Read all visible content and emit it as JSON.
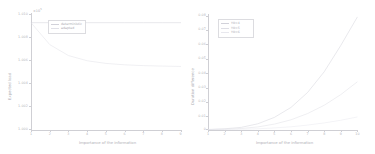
{
  "figure": {
    "panels": 2,
    "background": "#ffffff",
    "line_palette": [
      "#d7d7de",
      "#e3e3ea",
      "#ebebf1"
    ]
  },
  "left_panel": {
    "xlabel": "Importance of the information",
    "ylabel": "Expected load",
    "offset_label": "×10",
    "offset_exponent": "5",
    "ytick_labels": [
      "1.000",
      "1.002",
      "1.004",
      "1.006",
      "1.008",
      "1.010"
    ],
    "xtick_labels": [
      "1",
      "2",
      "3",
      "4",
      "5",
      "6",
      "7",
      "8",
      "9"
    ],
    "legend": {
      "items": [
        {
          "label": "deterministic",
          "color": "#d2d2da"
        },
        {
          "label": "adapted",
          "color": "#e0e0e7"
        }
      ]
    }
  },
  "right_panel": {
    "xlabel": "Importance of the information",
    "ylabel": "Duration difference",
    "ytick_labels": [
      "0",
      "0.01",
      "0.02",
      "0.03",
      "0.04",
      "0.05",
      "0.06",
      "0.07",
      "0.08"
    ],
    "xtick_labels": [
      "1",
      "2",
      "3",
      "4",
      "5",
      "6",
      "7",
      "8",
      "9",
      "10"
    ],
    "legend": {
      "items": [
        {
          "label": "Y0=4",
          "color": "#d2d2da"
        },
        {
          "label": "Y0=5",
          "color": "#dedee5"
        },
        {
          "label": "Y0=6",
          "color": "#e8e8ee"
        }
      ]
    }
  },
  "chart_data": [
    {
      "type": "line",
      "title": "",
      "xlabel": "Importance of the information",
      "ylabel": "Expected load",
      "xlim": [
        1,
        9
      ],
      "ylim": [
        100000,
        101000
      ],
      "y_offset_notation": "×10^5",
      "ytick_values": [
        100000,
        100200,
        100400,
        100600,
        100800,
        101000
      ],
      "ytick_labels": [
        "1.000",
        "1.002",
        "1.004",
        "1.006",
        "1.008",
        "1.010"
      ],
      "xtick_values": [
        1,
        2,
        3,
        4,
        5,
        6,
        7,
        8,
        9
      ],
      "grid": false,
      "legend_position": "upper-left",
      "x": [
        1,
        2,
        3,
        4,
        5,
        6,
        7,
        8,
        9
      ],
      "series": [
        {
          "name": "deterministic",
          "color": "#d2d2da",
          "values": [
            100925,
            100925,
            100925,
            100925,
            100925,
            100925,
            100925,
            100925,
            100925
          ]
        },
        {
          "name": "adapted",
          "color": "#e0e0e7",
          "values": [
            100925,
            100735,
            100640,
            100595,
            100572,
            100560,
            100553,
            100549,
            100546
          ]
        }
      ]
    },
    {
      "type": "line",
      "title": "",
      "xlabel": "Importance of the information",
      "ylabel": "Duration difference",
      "xlim": [
        1,
        10
      ],
      "ylim": [
        0,
        0.08
      ],
      "ytick_values": [
        0,
        0.01,
        0.02,
        0.03,
        0.04,
        0.05,
        0.06,
        0.07,
        0.08
      ],
      "ytick_labels": [
        "0",
        "0.01",
        "0.02",
        "0.03",
        "0.04",
        "0.05",
        "0.06",
        "0.07",
        "0.08"
      ],
      "xtick_values": [
        1,
        2,
        3,
        4,
        5,
        6,
        7,
        8,
        9,
        10
      ],
      "grid": false,
      "legend_position": "upper-left",
      "x": [
        1,
        2,
        3,
        4,
        5,
        6,
        7,
        8,
        9,
        10
      ],
      "series": [
        {
          "name": "Y0=4",
          "color": "#d2d2da",
          "values": [
            0.0,
            0.0005,
            0.0015,
            0.004,
            0.0085,
            0.0155,
            0.026,
            0.0405,
            0.059,
            0.079
          ]
        },
        {
          "name": "Y0=5",
          "color": "#dedee5",
          "values": [
            0.0,
            0.0002,
            0.0007,
            0.0018,
            0.0038,
            0.0068,
            0.0112,
            0.017,
            0.0245,
            0.0335
          ]
        },
        {
          "name": "Y0=6",
          "color": "#e8e8ee",
          "values": [
            0.0,
            0.0001,
            0.0002,
            0.0005,
            0.0011,
            0.0019,
            0.0031,
            0.0046,
            0.0065,
            0.0088
          ]
        }
      ]
    }
  ]
}
